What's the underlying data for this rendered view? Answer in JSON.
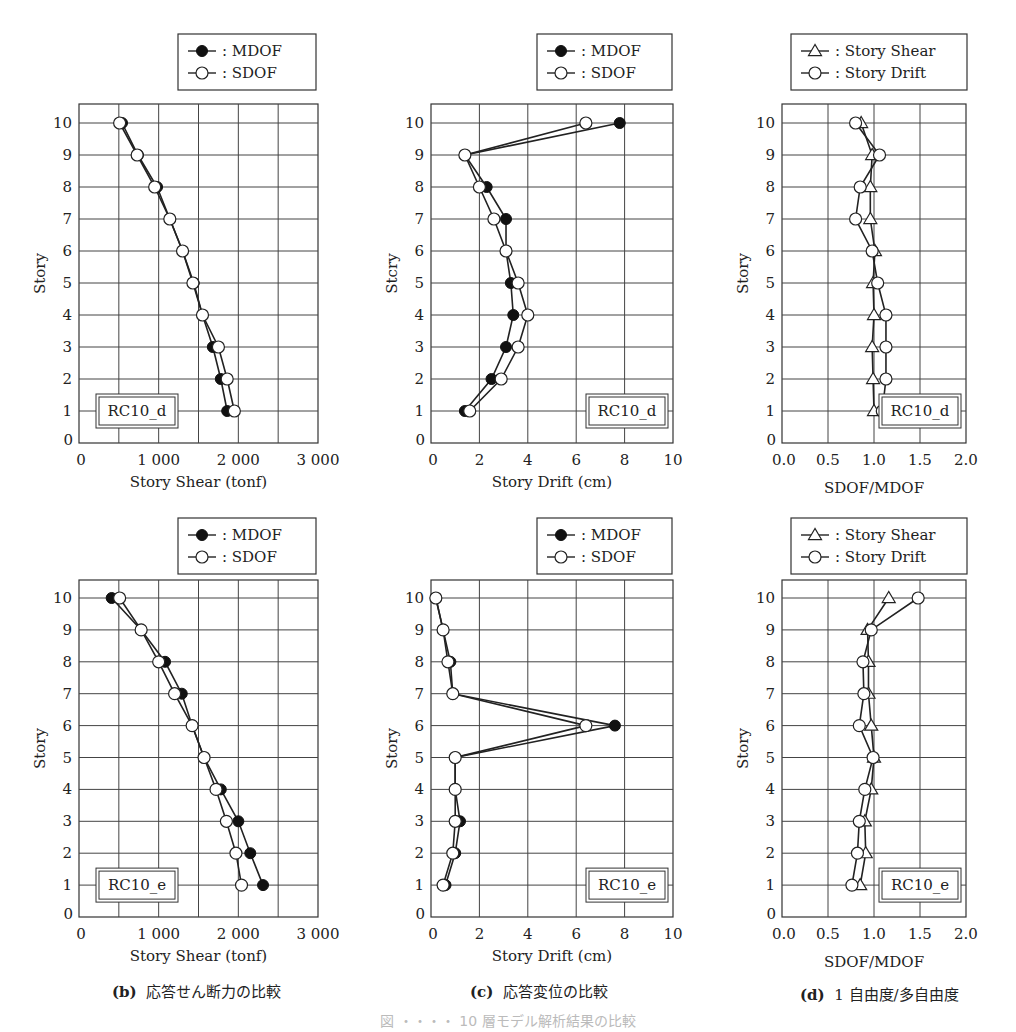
{
  "chart_data": [
    {
      "id": "b-d",
      "type": "line",
      "row": 0,
      "col": 0,
      "xlabel": "Story Shear (tonf)",
      "ylabel": "Story",
      "xlim": [
        0,
        3000
      ],
      "ylim": [
        0,
        10
      ],
      "xticks": [
        0,
        1000,
        2000,
        3000
      ],
      "xtick_labels": [
        "0",
        "1 000",
        "2 000",
        "3 000"
      ],
      "xgrid_step": 500,
      "yticks": [
        0,
        1,
        2,
        3,
        4,
        5,
        6,
        7,
        8,
        9,
        10
      ],
      "grid": true,
      "legend_position": "top-right-above",
      "tag": "RC10_d",
      "tag_position": "bottom-left",
      "legend": [
        {
          "name": "MDOF",
          "marker": "filled-circle"
        },
        {
          "name": "SDOF",
          "marker": "open-circle"
        }
      ],
      "y": [
        1,
        2,
        3,
        4,
        5,
        6,
        7,
        8,
        9,
        10
      ],
      "series": [
        {
          "name": "MDOF",
          "marker": "filled-circle",
          "values": [
            1860,
            1780,
            1680,
            1550,
            1440,
            1300,
            1140,
            980,
            740,
            540
          ]
        },
        {
          "name": "SDOF",
          "marker": "open-circle",
          "values": [
            1950,
            1860,
            1750,
            1550,
            1430,
            1300,
            1140,
            950,
            730,
            510
          ]
        }
      ]
    },
    {
      "id": "c-d",
      "type": "line",
      "row": 0,
      "col": 1,
      "xlabel": "Story Drift (cm)",
      "ylabel": "Stcry",
      "xlim": [
        0,
        10
      ],
      "ylim": [
        0,
        10
      ],
      "xticks": [
        0,
        2,
        4,
        6,
        8,
        10
      ],
      "xtick_labels": [
        "0",
        "2",
        "4",
        "6",
        "8",
        "10"
      ],
      "xgrid_step": 2,
      "yticks": [
        0,
        1,
        2,
        3,
        4,
        5,
        6,
        7,
        8,
        9,
        10
      ],
      "grid": true,
      "legend_position": "top-right-above",
      "tag": "RC10_d",
      "tag_position": "bottom-right",
      "legend": [
        {
          "name": "MDOF",
          "marker": "filled-circle"
        },
        {
          "name": "SDOF",
          "marker": "open-circle"
        }
      ],
      "y": [
        1,
        2,
        3,
        4,
        5,
        6,
        7,
        8,
        9,
        10
      ],
      "series": [
        {
          "name": "MDOF",
          "marker": "filled-circle",
          "values": [
            1.4,
            2.5,
            3.1,
            3.4,
            3.3,
            3.1,
            3.1,
            2.3,
            1.4,
            7.8
          ]
        },
        {
          "name": "SDOF",
          "marker": "open-circle",
          "values": [
            1.6,
            2.9,
            3.6,
            4.0,
            3.6,
            3.1,
            2.6,
            2.0,
            1.4,
            6.4
          ]
        }
      ]
    },
    {
      "id": "d-d",
      "type": "line",
      "row": 0,
      "col": 2,
      "xlabel": "SDOF/MDOF",
      "ylabel": "Story",
      "xlim": [
        0.0,
        2.0
      ],
      "ylim": [
        0,
        10
      ],
      "xticks": [
        0.0,
        0.5,
        1.0,
        1.5,
        2.0
      ],
      "xtick_labels": [
        "0.0",
        "0.5",
        "1.0",
        "1.5",
        "2.0"
      ],
      "xgrid_step": 0.5,
      "yticks": [
        0,
        1,
        2,
        3,
        4,
        5,
        6,
        7,
        8,
        9,
        10
      ],
      "grid": true,
      "legend_position": "top-right-above",
      "tag": "RC10_d",
      "tag_position": "bottom-right",
      "legend": [
        {
          "name": "Story Shear",
          "marker": "open-triangle"
        },
        {
          "name": "Story Drift",
          "marker": "open-circle"
        }
      ],
      "y": [
        1,
        2,
        3,
        4,
        5,
        6,
        7,
        8,
        9,
        10
      ],
      "series": [
        {
          "name": "Story Shear",
          "marker": "open-triangle",
          "values": [
            1.0,
            0.99,
            0.98,
            1.0,
            0.99,
            1.01,
            0.96,
            0.96,
            0.98,
            0.86
          ]
        },
        {
          "name": "Story Drift",
          "marker": "open-circle",
          "values": [
            1.09,
            1.13,
            1.13,
            1.13,
            1.04,
            0.98,
            0.8,
            0.85,
            1.06,
            0.8
          ]
        }
      ]
    },
    {
      "id": "b-e",
      "type": "line",
      "row": 1,
      "col": 0,
      "xlabel": "Story Shear (tonf)",
      "ylabel": "Story",
      "xlim": [
        0,
        3000
      ],
      "ylim": [
        0,
        10
      ],
      "xticks": [
        0,
        1000,
        2000,
        3000
      ],
      "xtick_labels": [
        "0",
        "1 000",
        "2 000",
        "3 000"
      ],
      "xgrid_step": 500,
      "yticks": [
        0,
        1,
        2,
        3,
        4,
        5,
        6,
        7,
        8,
        9,
        10
      ],
      "grid": true,
      "legend_position": "top-right-above",
      "tag": "RC10_e",
      "tag_position": "bottom-left",
      "legend": [
        {
          "name": "MDOF",
          "marker": "filled-circle"
        },
        {
          "name": "SDOF",
          "marker": "open-circle"
        }
      ],
      "y": [
        1,
        2,
        3,
        4,
        5,
        6,
        7,
        8,
        9,
        10
      ],
      "series": [
        {
          "name": "MDOF",
          "marker": "filled-circle",
          "values": [
            2310,
            2150,
            2000,
            1780,
            1570,
            1420,
            1290,
            1080,
            780,
            410
          ]
        },
        {
          "name": "SDOF",
          "marker": "open-circle",
          "values": [
            2040,
            1970,
            1850,
            1720,
            1570,
            1420,
            1200,
            1000,
            780,
            510
          ]
        }
      ]
    },
    {
      "id": "c-e",
      "type": "line",
      "row": 1,
      "col": 1,
      "xlabel": "Story Drift (cm)",
      "ylabel": "Story",
      "xlim": [
        0,
        10
      ],
      "ylim": [
        0,
        10
      ],
      "xticks": [
        0,
        2,
        4,
        6,
        8,
        10
      ],
      "xtick_labels": [
        "0",
        "2",
        "4",
        "6",
        "8",
        "10"
      ],
      "xgrid_step": 2,
      "yticks": [
        0,
        1,
        2,
        3,
        4,
        5,
        6,
        7,
        8,
        9,
        10
      ],
      "grid": true,
      "legend_position": "top-right-above",
      "tag": "RC10_e",
      "tag_position": "bottom-right",
      "legend": [
        {
          "name": "MDOF",
          "marker": "filled-circle"
        },
        {
          "name": "SDOF",
          "marker": "open-circle"
        }
      ],
      "y": [
        1,
        2,
        3,
        4,
        5,
        6,
        7,
        8,
        9,
        10
      ],
      "series": [
        {
          "name": "MDOF",
          "marker": "filled-circle",
          "values": [
            0.6,
            1.0,
            1.2,
            1.0,
            1.0,
            7.6,
            0.9,
            0.8,
            0.5,
            0.2
          ]
        },
        {
          "name": "SDOF",
          "marker": "open-circle",
          "values": [
            0.5,
            0.9,
            1.0,
            1.0,
            1.0,
            6.4,
            0.9,
            0.7,
            0.5,
            0.2
          ]
        }
      ]
    },
    {
      "id": "d-e",
      "type": "line",
      "row": 1,
      "col": 2,
      "xlabel": "SDOF/MDOF",
      "ylabel": "Story",
      "xlim": [
        0.0,
        2.0
      ],
      "ylim": [
        0,
        10
      ],
      "xticks": [
        0.0,
        0.5,
        1.0,
        1.5,
        2.0
      ],
      "xtick_labels": [
        "0.0",
        "0.5",
        "1.0",
        "1.5",
        "2.0"
      ],
      "xgrid_step": 0.5,
      "yticks": [
        0,
        1,
        2,
        3,
        4,
        5,
        6,
        7,
        8,
        9,
        10
      ],
      "grid": true,
      "legend_position": "top-right-above",
      "tag": "RC10_e",
      "tag_position": "bottom-right",
      "legend": [
        {
          "name": "Story Shear",
          "marker": "open-triangle"
        },
        {
          "name": "Story Drift",
          "marker": "open-circle"
        }
      ],
      "y": [
        1,
        2,
        3,
        4,
        5,
        6,
        7,
        8,
        9,
        10
      ],
      "series": [
        {
          "name": "Story Shear",
          "marker": "open-triangle",
          "values": [
            0.85,
            0.91,
            0.9,
            0.97,
            1.0,
            0.97,
            0.94,
            0.94,
            0.93,
            1.16
          ]
        },
        {
          "name": "Story Drift",
          "marker": "open-circle",
          "values": [
            0.76,
            0.82,
            0.84,
            0.9,
            0.99,
            0.84,
            0.89,
            0.88,
            0.97,
            1.48
          ]
        }
      ]
    }
  ],
  "captions": [
    {
      "letter": "(b)",
      "text": "応答せん断力の比較"
    },
    {
      "letter": "(c)",
      "text": "応答変位の比較"
    },
    {
      "letter": "(d)",
      "text": "1 自由度/多自由度"
    }
  ],
  "figure_caption": "図 ・・・・ 10 層モデル解析結果の比較"
}
